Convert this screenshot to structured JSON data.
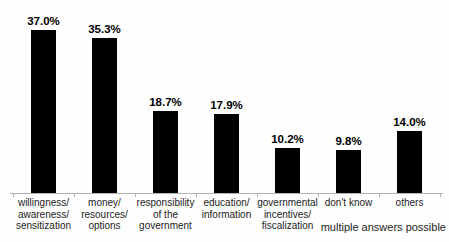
{
  "chart_data": {
    "type": "bar",
    "title": "",
    "xlabel": "",
    "ylabel": "",
    "categories": [
      [
        "willingness/",
        "awareness/",
        "sensitization"
      ],
      [
        "money/",
        "resources/",
        "options"
      ],
      [
        "responsibility",
        "of the",
        "government"
      ],
      [
        "education/",
        "information"
      ],
      [
        "governmental",
        "incentives/",
        "fiscalization"
      ],
      [
        "don't know"
      ],
      [
        "others"
      ]
    ],
    "values": [
      37.0,
      35.3,
      18.7,
      17.9,
      10.2,
      9.8,
      14.0
    ],
    "value_labels": [
      "37.0%",
      "35.3%",
      "18.7%",
      "17.9%",
      "10.2%",
      "9.8%",
      "14.0%"
    ],
    "ylim": [
      0,
      40
    ],
    "grid": false,
    "legend": false,
    "bar_color": "#000000",
    "axis_color": "#b3b3b3",
    "note": "multiple answers possible"
  }
}
